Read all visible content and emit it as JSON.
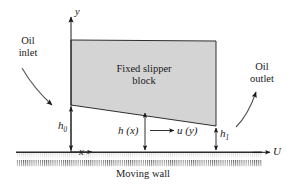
{
  "figure": {
    "type": "slipper-bearing-lubrication-diagram",
    "block_label_line1": "Fixed slipper",
    "block_label_line2": "block",
    "wall_label": "Moving wall",
    "inlet_line1": "Oil",
    "inlet_line2": "inlet",
    "outlet_line1": "Oil",
    "outlet_line2": "outlet"
  },
  "axes": {
    "y_axis_label": "y",
    "x_axis_label": "x"
  },
  "dimensions": {
    "h0_base": "h",
    "h0_sub": "0",
    "h1_base": "h",
    "h1_sub": "1",
    "hx_label": "h (x)"
  },
  "velocities": {
    "fluid_profile_label": "u (y)",
    "wall_velocity_label": "U"
  },
  "colors": {
    "block_fill": "#d4d4d4",
    "line": "#1a1a1a",
    "wall": "#2b2b2b",
    "text": "#1a1a1a"
  },
  "geometry": {
    "block_top_left_x": 71,
    "block_top_y": 40,
    "block_top_right_x": 216,
    "block_bottom_left_y": 105,
    "block_bottom_right_y": 126,
    "wall_y": 152,
    "origin_x": 71
  }
}
